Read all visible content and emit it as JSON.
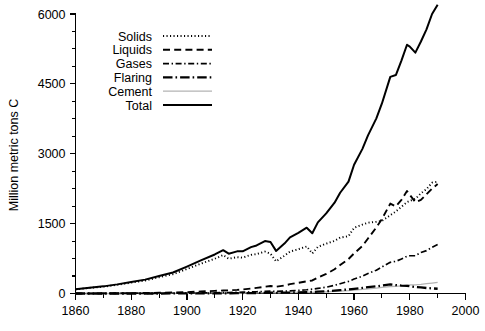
{
  "chart_data": {
    "type": "line",
    "title": "",
    "xlabel": "",
    "ylabel": "Million metric tons C",
    "xlim": [
      1860,
      2000
    ],
    "ylim": [
      0,
      6000
    ],
    "x_ticks": [
      1860,
      1880,
      1900,
      1920,
      1940,
      1960,
      1980,
      2000
    ],
    "x_minor_ticks": [
      1870,
      1890,
      1910,
      1930,
      1950,
      1970,
      1990
    ],
    "y_ticks": [
      0,
      1500,
      3000,
      4500,
      6000
    ],
    "y_minor_ticks": [
      375,
      750,
      1125,
      1875,
      2250,
      2625,
      3375,
      3750,
      4125,
      4875,
      5250,
      5625
    ],
    "grid": false,
    "legend_position": "upper-left-inside",
    "x": [
      1860,
      1865,
      1870,
      1875,
      1880,
      1885,
      1890,
      1895,
      1900,
      1905,
      1910,
      1913,
      1915,
      1918,
      1920,
      1923,
      1925,
      1928,
      1930,
      1932,
      1935,
      1937,
      1940,
      1943,
      1945,
      1947,
      1950,
      1953,
      1955,
      1958,
      1960,
      1963,
      1965,
      1968,
      1970,
      1973,
      1975,
      1977,
      1979,
      1980,
      1982,
      1984,
      1986,
      1988,
      1990
    ],
    "series": [
      {
        "name": "Solids",
        "style": "dotted",
        "color": "#000000",
        "values": [
          90,
          120,
          147,
          186,
          233,
          278,
          350,
          414,
          525,
          640,
          746,
          825,
          746,
          780,
          770,
          830,
          845,
          900,
          855,
          690,
          810,
          900,
          950,
          1010,
          860,
          1000,
          1070,
          1130,
          1200,
          1230,
          1410,
          1480,
          1520,
          1540,
          1560,
          1680,
          1760,
          1860,
          1960,
          1990,
          2030,
          2150,
          2240,
          2380,
          2400
        ]
      },
      {
        "name": "Liquids",
        "style": "dashed",
        "color": "#000000",
        "values": [
          0,
          1,
          2,
          4,
          7,
          10,
          15,
          21,
          30,
          42,
          56,
          65,
          68,
          78,
          88,
          105,
          120,
          145,
          160,
          145,
          170,
          200,
          230,
          260,
          280,
          340,
          420,
          520,
          610,
          740,
          860,
          1020,
          1180,
          1420,
          1600,
          1930,
          1870,
          2010,
          2200,
          2120,
          1960,
          2010,
          2130,
          2250,
          2350
        ]
      },
      {
        "name": "Gases",
        "style": "dashdot-fine",
        "color": "#000000",
        "values": [
          0,
          0,
          1,
          1,
          2,
          3,
          5,
          7,
          9,
          12,
          16,
          19,
          21,
          26,
          29,
          34,
          38,
          45,
          50,
          44,
          50,
          58,
          68,
          80,
          92,
          110,
          135,
          175,
          210,
          260,
          310,
          370,
          430,
          500,
          570,
          670,
          690,
          740,
          800,
          810,
          810,
          880,
          920,
          990,
          1050
        ]
      },
      {
        "name": "Flaring",
        "style": "dashdot-bold",
        "color": "#000000",
        "values": [
          0,
          0,
          0,
          0,
          0,
          0,
          0,
          1,
          1,
          2,
          3,
          4,
          5,
          6,
          7,
          9,
          11,
          14,
          16,
          15,
          17,
          20,
          24,
          28,
          32,
          40,
          50,
          62,
          72,
          88,
          100,
          120,
          135,
          155,
          170,
          195,
          180,
          170,
          165,
          155,
          140,
          130,
          118,
          110,
          102
        ]
      },
      {
        "name": "Cement",
        "style": "solid-thin-gray",
        "color": "#b3b3b3",
        "values": [
          0,
          0,
          0,
          0,
          1,
          1,
          2,
          3,
          4,
          5,
          7,
          8,
          8,
          9,
          10,
          12,
          14,
          17,
          19,
          16,
          19,
          22,
          25,
          27,
          22,
          28,
          35,
          45,
          52,
          63,
          73,
          88,
          98,
          115,
          130,
          150,
          155,
          165,
          180,
          185,
          185,
          195,
          210,
          225,
          240
        ]
      },
      {
        "name": "Total",
        "style": "solid",
        "color": "#000000",
        "values": [
          93,
          124,
          153,
          196,
          247,
          298,
          377,
          451,
          577,
          710,
          838,
          930,
          855,
          905,
          905,
          995,
          1032,
          1126,
          1105,
          915,
          1071,
          1205,
          1303,
          1412,
          1294,
          1526,
          1720,
          1950,
          2163,
          2402,
          2765,
          3105,
          3395,
          3760,
          4080,
          4650,
          4690,
          5000,
          5340,
          5300,
          5170,
          5410,
          5670,
          6000,
          6200
        ]
      }
    ],
    "legend": [
      {
        "label": "Solids",
        "style": "dotted"
      },
      {
        "label": "Liquids",
        "style": "dashed"
      },
      {
        "label": "Gases",
        "style": "dashdot-fine"
      },
      {
        "label": "Flaring",
        "style": "dashdot-bold"
      },
      {
        "label": "Cement",
        "style": "solid-thin-gray"
      },
      {
        "label": "Total",
        "style": "solid"
      }
    ]
  }
}
